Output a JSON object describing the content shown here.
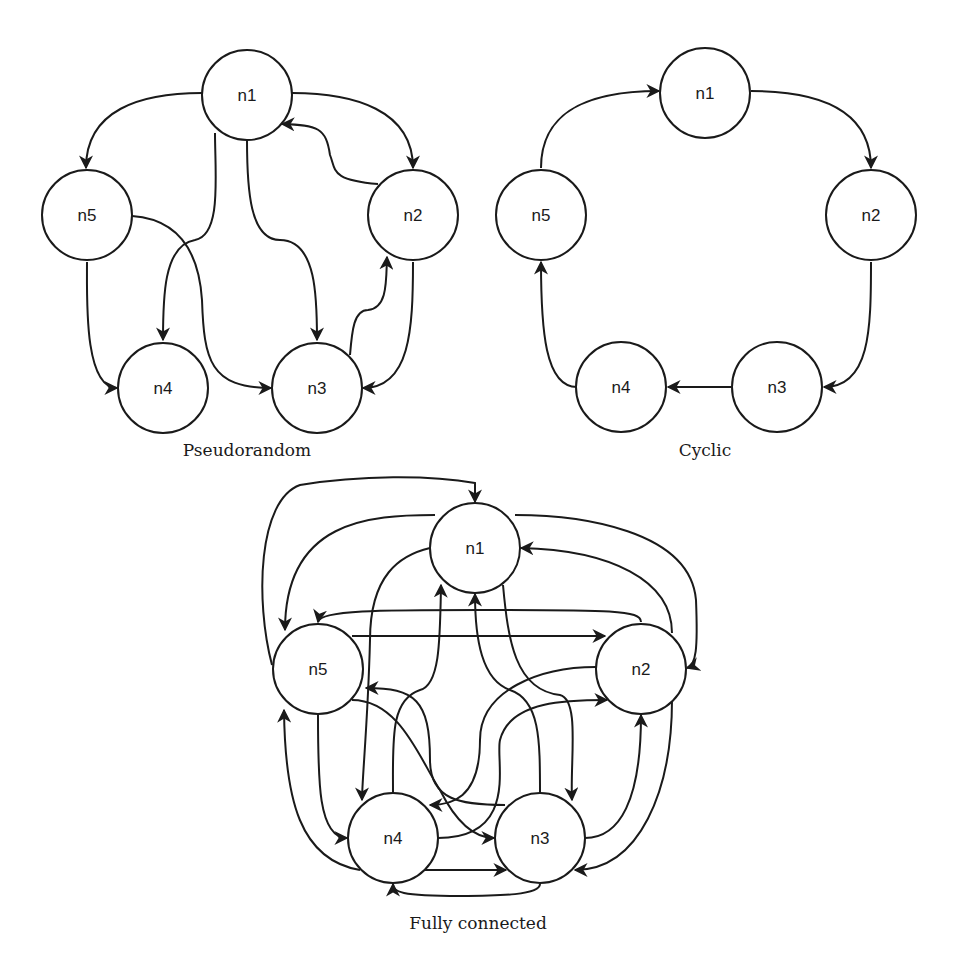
{
  "figure": {
    "header_fragment": "",
    "colors": {
      "stroke": "#1a1a1a",
      "background": "#ffffff"
    },
    "node_radius": 45,
    "graphs": [
      {
        "id": "pseudorandom",
        "caption": "Pseudorandom",
        "caption_pos": [
          247,
          452
        ],
        "nodes": [
          {
            "id": "n1",
            "label": "n1",
            "x": 247,
            "y": 95
          },
          {
            "id": "n2",
            "label": "n2",
            "x": 413,
            "y": 215
          },
          {
            "id": "n3",
            "label": "n3",
            "x": 317,
            "y": 388
          },
          {
            "id": "n4",
            "label": "n4",
            "x": 163,
            "y": 388
          },
          {
            "id": "n5",
            "label": "n5",
            "x": 87,
            "y": 215
          }
        ],
        "edges": [
          {
            "from": "n1",
            "to": "n5",
            "path": "M202,93 C140,93 86,110 86,168"
          },
          {
            "from": "n1",
            "to": "n2",
            "path": "M292,93 C354,93 413,110 413,168"
          },
          {
            "from": "n2",
            "to": "n1",
            "path": "M378,184 C330,180 336,170 330,155 C326,128 318,125 282,124"
          },
          {
            "from": "n1",
            "to": "n4",
            "path": "M215,133 C215,175 222,235 195,240 C163,245 163,300 163,340"
          },
          {
            "from": "n1",
            "to": "n3",
            "path": "M247,140 C247,190 250,240 280,240 C317,240 317,300 317,340"
          },
          {
            "from": "n5",
            "to": "n4",
            "path": "M87,262 C87,300 84,388 117,388"
          },
          {
            "from": "n5",
            "to": "n3",
            "path": "M132,216 C190,220 200,270 202,300 C204,360 210,388 271,388"
          },
          {
            "from": "n3",
            "to": "n2",
            "path": "M350,355 C352,330 354,310 368,310 C388,308 386,280 387,257"
          },
          {
            "from": "n2",
            "to": "n3",
            "path": "M413,262 C413,330 410,388 363,388"
          }
        ]
      },
      {
        "id": "cyclic",
        "caption": "Cyclic",
        "caption_pos": [
          705,
          452
        ],
        "nodes": [
          {
            "id": "n1",
            "label": "n1",
            "x": 705,
            "y": 93
          },
          {
            "id": "n2",
            "label": "n2",
            "x": 871,
            "y": 215
          },
          {
            "id": "n3",
            "label": "n3",
            "x": 777,
            "y": 387
          },
          {
            "id": "n4",
            "label": "n4",
            "x": 621,
            "y": 387
          },
          {
            "id": "n5",
            "label": "n5",
            "x": 541,
            "y": 215
          }
        ],
        "edges": [
          {
            "from": "n1",
            "to": "n2",
            "path": "M751,91 C820,91 871,110 871,168"
          },
          {
            "from": "n2",
            "to": "n3",
            "path": "M871,262 C871,330 870,387 824,387"
          },
          {
            "from": "n3",
            "to": "n4",
            "path": "M731,387 L668,387"
          },
          {
            "from": "n4",
            "to": "n5",
            "path": "M577,387 C545,387 541,330 541,262"
          },
          {
            "from": "n5",
            "to": "n1",
            "path": "M541,168 C541,110 590,91 659,91"
          }
        ]
      },
      {
        "id": "fully-connected",
        "caption": "Fully connected",
        "caption_pos": [
          478,
          925
        ],
        "nodes": [
          {
            "id": "n1",
            "label": "n1",
            "x": 475,
            "y": 548
          },
          {
            "id": "n2",
            "label": "n2",
            "x": 641,
            "y": 669
          },
          {
            "id": "n3",
            "label": "n3",
            "x": 540,
            "y": 838
          },
          {
            "id": "n4",
            "label": "n4",
            "x": 393,
            "y": 838
          },
          {
            "id": "n5",
            "label": "n5",
            "x": 318,
            "y": 669
          }
        ],
        "edges": [
          {
            "from": "n5",
            "to": "n1",
            "path": "M272,665 C255,600 258,500 300,485 C360,475 430,475 475,483 L475,502"
          },
          {
            "from": "n1",
            "to": "n5",
            "path": "M435,515 C370,515 285,520 285,630"
          },
          {
            "from": "n1",
            "to": "n2",
            "path": "M515,515 C580,515 690,530 696,600 C698,650 696,665 687,668"
          },
          {
            "from": "n2",
            "to": "n1",
            "path": "M672,633 C672,580 610,550 521,548"
          },
          {
            "from": "n2",
            "to": "n5",
            "path": "M641,622 C641,610 610,610 480,610 C380,610 320,610 318,622"
          },
          {
            "from": "n5",
            "to": "n2",
            "path": "M352,636 L605,636"
          },
          {
            "from": "n1",
            "to": "n4",
            "path": "M430,548 C400,555 370,575 370,640 C368,720 362,780 362,800"
          },
          {
            "from": "n4",
            "to": "n1",
            "path": "M393,793 C393,740 390,700 420,690 C440,685 440,640 441,585"
          },
          {
            "from": "n1",
            "to": "n3",
            "path": "M503,585 C508,640 515,690 560,695 C580,700 570,760 572,800"
          },
          {
            "from": "n3",
            "to": "n1",
            "path": "M540,793 C540,740 540,700 510,690 C482,680 475,640 475,594"
          },
          {
            "from": "n2",
            "to": "n4",
            "path": "M596,667 C540,667 480,690 480,740 C480,800 450,805 430,805"
          },
          {
            "from": "n4",
            "to": "n2",
            "path": "M438,838 C520,838 495,760 500,740 C510,700 570,700 607,700"
          },
          {
            "from": "n5",
            "to": "n3",
            "path": "M352,700 C400,700 420,760 440,790 C460,830 480,838 494,838"
          },
          {
            "from": "n3",
            "to": "n5",
            "path": "M505,805 C460,805 430,800 430,760 C430,700 415,688 366,688"
          },
          {
            "from": "n5",
            "to": "n4",
            "path": "M318,715 C318,780 318,838 347,838"
          },
          {
            "from": "n4",
            "to": "n5",
            "path": "M360,870 C300,860 285,800 284,710"
          },
          {
            "from": "n3",
            "to": "n2",
            "path": "M585,838 C620,838 641,800 641,715"
          },
          {
            "from": "n2",
            "to": "n3",
            "path": "M672,700 C672,790 640,870 575,870"
          },
          {
            "from": "n4",
            "to": "n3",
            "path": "M425,870 L506,870"
          },
          {
            "from": "n3",
            "to": "n4",
            "path": "M540,884 C540,895 500,896 460,896 C400,896 393,892 393,884"
          }
        ]
      }
    ]
  }
}
